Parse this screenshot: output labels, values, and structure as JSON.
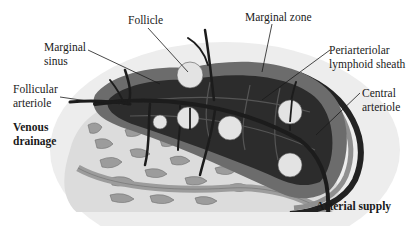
{
  "diagram": {
    "labels": {
      "follicle": [
        "Follicle"
      ],
      "marginal_zone": [
        "Marginal zone"
      ],
      "marginal_sinus": [
        "Marginal",
        "sinus"
      ],
      "pals": [
        "Periarteriolar",
        "lymphoid sheath"
      ],
      "follicular_arteriole": [
        "Follicular",
        "arteriole"
      ],
      "central_arteriole": [
        "Central",
        "arteriole"
      ],
      "venous_drainage": [
        "Venous",
        "drainage"
      ],
      "arterial_supply": [
        "Arterial supply"
      ]
    },
    "colors": {
      "background": "#ffffff",
      "outer_halo": "#ececec",
      "red_pulp": "#d6d6d6",
      "sinus_tissue": "#9a9a9a",
      "marginal_zone": "#6a6a6a",
      "pals": "#2e2e2e",
      "vessels": "#1e1e1e",
      "follicle": "#e2e2e2",
      "text": "#1a1a1a"
    }
  }
}
